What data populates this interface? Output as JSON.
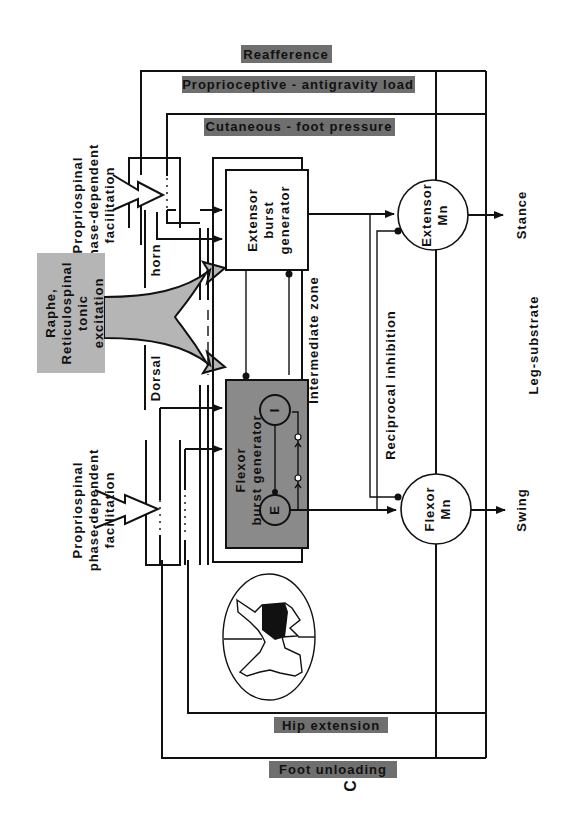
{
  "figure": {
    "panel_letter": "C",
    "colors": {
      "band_fill": "#6f6f6f",
      "flexor_box_fill": "#8a8a8a",
      "descending_fill": "#b5b5b5",
      "line": "#111111",
      "background": "#ffffff"
    }
  },
  "feedback_bands": {
    "reafference": "Reafference",
    "proprioceptive": "Proprioceptive - antigravity load",
    "cutaneous": "Cutaneous - foot pressure",
    "hip_extension": "Hip extension",
    "foot_unloading": "Foot unloading"
  },
  "descending": {
    "line1": "Raphe,",
    "line2": "Reticulospinal",
    "line3": "tonic",
    "line4": "excitation"
  },
  "propriospinal_top": {
    "line1": "Propriospinal",
    "line2": "phase-dependent",
    "line3": "facilitation"
  },
  "propriospinal_bottom": {
    "line1": "Propriospinal",
    "line2": "phase-dependent",
    "line3": "facilitation"
  },
  "zones": {
    "dorsal": "Dorsal",
    "horn": "horn",
    "intermediate": "Intermediate zone",
    "reciprocal": "Reciprocal inhibition",
    "leg_substrate": "Leg-substrate"
  },
  "generators": {
    "extensor": {
      "line1": "Extensor",
      "line2": "burst",
      "line3": "generator"
    },
    "flexor": {
      "line1": "Flexor",
      "line2": "burst generator",
      "inhibitory": "I",
      "excitatory": "E"
    }
  },
  "motoneurons": {
    "extensor": {
      "line1": "Extensor",
      "line2": "Mn"
    },
    "flexor": {
      "line1": "Flexor",
      "line2": "Mn"
    }
  },
  "outputs": {
    "stance": "Stance",
    "swing": "Swing"
  }
}
